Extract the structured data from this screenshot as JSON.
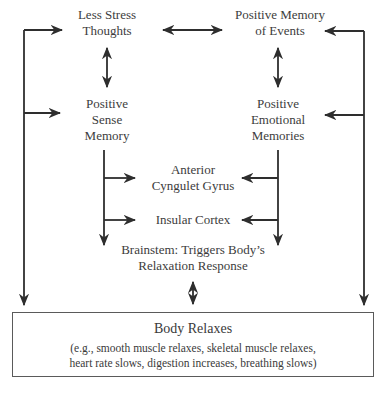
{
  "diagram": {
    "nodes": {
      "less_stress": {
        "lines": [
          "Less Stress",
          "Thoughts"
        ]
      },
      "positive_memory_events": {
        "lines": [
          "Positive Memory",
          "of Events"
        ]
      },
      "positive_sense_memory": {
        "lines": [
          "Positive",
          "Sense",
          "Memory"
        ]
      },
      "positive_emotional_memories": {
        "lines": [
          "Positive",
          "Emotional",
          "Memories"
        ]
      },
      "anterior_cyngulet": {
        "lines": [
          "Anterior",
          "Cyngulet Gyrus"
        ]
      },
      "insular_cortex": {
        "lines": [
          "Insular Cortex"
        ]
      },
      "brainstem": {
        "lines": [
          "Brainstem: Triggers Body’s",
          "Relaxation Response"
        ]
      }
    },
    "outcome": {
      "title": "Body Relaxes",
      "detail_lines": [
        "(e.g., smooth muscle relaxes, skeletal muscle relaxes,",
        "heart rate slows, digestion increases, breathing slows)"
      ]
    },
    "edges": [
      {
        "from": "Less Stress Thoughts",
        "to": "Positive Memory of Events",
        "type": "bidirectional"
      },
      {
        "from": "Less Stress Thoughts",
        "to": "Positive Sense Memory",
        "type": "bidirectional"
      },
      {
        "from": "Positive Memory of Events",
        "to": "Positive Emotional Memories",
        "type": "bidirectional"
      },
      {
        "from": "Positive Sense Memory",
        "to": "Anterior Cyngulet Gyrus",
        "type": "directed"
      },
      {
        "from": "Positive Sense Memory",
        "to": "Insular Cortex",
        "type": "directed"
      },
      {
        "from": "Positive Sense Memory",
        "to": "Brainstem",
        "type": "directed"
      },
      {
        "from": "Positive Emotional Memories",
        "to": "Anterior Cyngulet Gyrus",
        "type": "directed"
      },
      {
        "from": "Positive Emotional Memories",
        "to": "Insular Cortex",
        "type": "directed"
      },
      {
        "from": "Positive Emotional Memories",
        "to": "Brainstem",
        "type": "directed"
      },
      {
        "from": "Brainstem",
        "to": "Body Relaxes",
        "type": "bidirectional"
      },
      {
        "from": "Body Relaxes (left loop)",
        "to": "Less Stress Thoughts",
        "type": "feedback"
      },
      {
        "from": "Body Relaxes (left loop)",
        "to": "Positive Sense Memory",
        "type": "feedback"
      },
      {
        "from": "Body Relaxes (right loop)",
        "to": "Positive Memory of Events",
        "type": "feedback"
      },
      {
        "from": "Body Relaxes (right loop)",
        "to": "Positive Emotional Memories",
        "type": "feedback"
      }
    ],
    "colors": {
      "arrow": "#2e2e2e",
      "text": "#3a3a3a",
      "box_border": "#5a5a5a"
    }
  }
}
